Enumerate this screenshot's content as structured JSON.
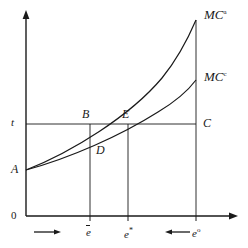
{
  "figure": {
    "background_color": "#ffffff",
    "line_color": "#1a1a1a"
  },
  "axes": {
    "origin_label": "0",
    "y_axis_name": "vertical-axis",
    "x_axis_name": "horizontal-axis",
    "tax_level_label": "t"
  },
  "curves": [
    {
      "id": "mc-a",
      "label_base": "MC",
      "label_sup": "a",
      "description": "steep convex marginal cost curve"
    },
    {
      "id": "mc-c",
      "label_base": "MC",
      "label_sup": "c",
      "description": "flatter convex marginal cost curve"
    }
  ],
  "points": [
    {
      "id": "A",
      "label": "A"
    },
    {
      "id": "B",
      "label": "B"
    },
    {
      "id": "C",
      "label": "C"
    },
    {
      "id": "D",
      "label": "D"
    },
    {
      "id": "E",
      "label": "E"
    }
  ],
  "x_ticks": [
    {
      "id": "e-bar",
      "base": "e",
      "mark": "bar"
    },
    {
      "id": "e-star",
      "base": "e",
      "mark": "star",
      "sup": "*"
    },
    {
      "id": "e-circ",
      "base": "e",
      "mark": "circ",
      "sup": "o"
    }
  ],
  "annotations": [
    {
      "id": "arrow-right",
      "glyph": "→",
      "direction": "right"
    },
    {
      "id": "arrow-left",
      "glyph": "←",
      "direction": "left"
    }
  ]
}
